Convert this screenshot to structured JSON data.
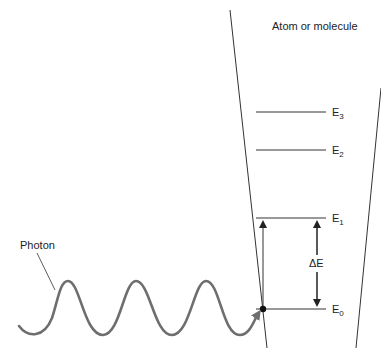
{
  "title_label": "Atom or molecule",
  "photon_label": "Photon",
  "delta_label": "ΔE",
  "levels": [
    {
      "name": "E",
      "sub": "0",
      "y": 309
    },
    {
      "name": "E",
      "sub": "1",
      "y": 218
    },
    {
      "name": "E",
      "sub": "2",
      "y": 150
    },
    {
      "name": "E",
      "sub": "3",
      "y": 112
    }
  ],
  "colors": {
    "line": "#333333",
    "wave": "#6e6e6e",
    "text": "#222222"
  }
}
